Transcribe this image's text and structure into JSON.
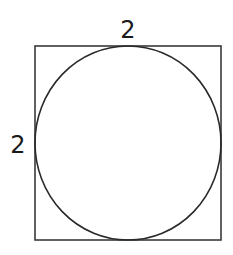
{
  "diagram": {
    "square": {
      "x": 35,
      "y": 46,
      "width": 186,
      "height": 194,
      "stroke": "#3a3a3a"
    },
    "circle": {
      "cx": 128,
      "cy": 143,
      "rx": 93,
      "ry": 97,
      "stroke": "#2a2a2a"
    },
    "labels": {
      "top": "2",
      "left": "2"
    }
  }
}
